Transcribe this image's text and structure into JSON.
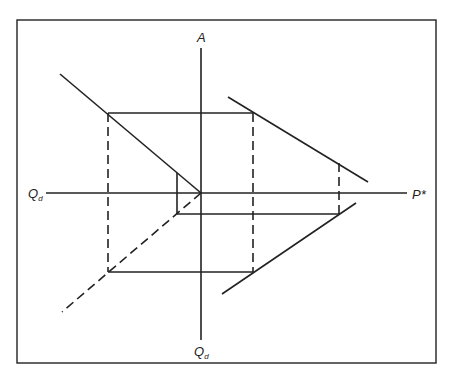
{
  "diagram": {
    "title": "",
    "frame": {
      "x": 17,
      "y": 20,
      "width": 419,
      "height": 343
    },
    "stroke_color": "#222222",
    "origin": {
      "x": 201,
      "y": 193
    },
    "labels": {
      "top_axis": "A",
      "left_axis_main": "Q",
      "left_axis_sub": "d",
      "right_axis": "P*",
      "bottom_axis_main": "Q",
      "bottom_axis_sub": "d"
    },
    "axes": {
      "horizontal": {
        "x1": 46,
        "y1": 193,
        "x2": 407,
        "y2": 193
      },
      "vertical": {
        "x1": 201,
        "y1": 48,
        "x2": 201,
        "y2": 340
      }
    },
    "solid_lines": [
      {
        "name": "upper-left-curve",
        "x1": 60,
        "y1": 74,
        "x2": 201,
        "y2": 193
      },
      {
        "name": "upper-right-curve",
        "x1": 228,
        "y1": 97,
        "x2": 368,
        "y2": 182
      },
      {
        "name": "lower-right-curve",
        "x1": 222,
        "y1": 294,
        "x2": 356,
        "y2": 203
      },
      {
        "name": "top-rectangle-edge",
        "x1": 108,
        "y1": 113,
        "x2": 253,
        "y2": 113
      },
      {
        "name": "bottom-rectangle-edge",
        "x1": 108,
        "y1": 272,
        "x2": 253,
        "y2": 272
      },
      {
        "name": "small-vertical",
        "x1": 177,
        "y1": 173,
        "x2": 177,
        "y2": 214
      },
      {
        "name": "small-horizontal",
        "x1": 177,
        "y1": 214,
        "x2": 339,
        "y2": 214
      }
    ],
    "dashed_lines": [
      {
        "name": "lower-left-dashed-ray",
        "x1": 201,
        "y1": 193,
        "x2": 62,
        "y2": 312
      },
      {
        "name": "left-dashed-vertical",
        "x1": 108,
        "y1": 113,
        "x2": 108,
        "y2": 272
      },
      {
        "name": "middle-dashed-vertical",
        "x1": 253,
        "y1": 113,
        "x2": 253,
        "y2": 272
      },
      {
        "name": "right-dashed-vertical",
        "x1": 339,
        "y1": 163,
        "x2": 339,
        "y2": 214
      }
    ]
  }
}
